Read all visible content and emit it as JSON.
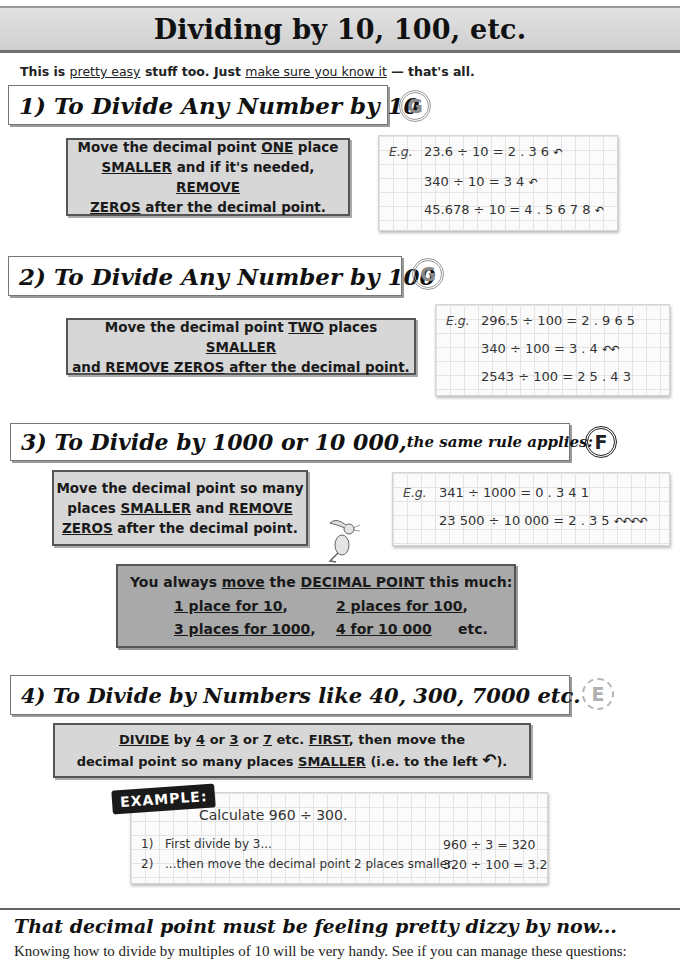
{
  "page": {
    "title": "Dividing by 10, 100, etc.",
    "intro": {
      "p1": "This is ",
      "u1": "pretty easy",
      "p2": " stuff too.  Just ",
      "u2": "make sure you know it",
      "p3": " — that's all."
    }
  },
  "sections": [
    {
      "heading": "1) To Divide Any Number by 10",
      "grade": "G",
      "rule": {
        "l1a": "Move the decimal point ",
        "l1u": "ONE",
        "l1b": " place",
        "l2u": "SMALLER",
        "l2a": " and if it's needed, ",
        "l2u2": "REMOVE",
        "l3u": "ZEROS",
        "l3a": " after the decimal point."
      },
      "example": {
        "label": "E.g.",
        "lines": [
          {
            "eq": "23.6 ÷ 10 = 2 . 3 6",
            "arrows": "↶"
          },
          {
            "eq": "340 ÷ 10 = 3 4",
            "arrows": "↶"
          },
          {
            "eq": "45.678 ÷ 10 = 4 . 5 6 7 8",
            "arrows": "↶"
          }
        ]
      }
    },
    {
      "heading": "2) To Divide Any Number by 100",
      "grade": "G",
      "rule": {
        "l1a": "Move the decimal point ",
        "l1u": "TWO",
        "l1b": " places ",
        "l1u2": "SMALLER",
        "l2a": "and ",
        "l2u": "REMOVE ZEROS",
        "l2b": " after the decimal point."
      },
      "example": {
        "label": "E.g.",
        "lines": [
          {
            "eq": "296.5 ÷ 100  = 2 . 9 6 5",
            "arrows": "↶↶"
          },
          {
            "eq": "340 ÷ 100 = 3 . 4",
            "arrows": "↶↶"
          },
          {
            "eq": "2543 ÷ 100 = 2 5 . 4 3",
            "arrows": "↶↶"
          }
        ]
      }
    },
    {
      "heading_main": "3) To Divide by 1000 or 10 000,",
      "heading_sub": " the same rule applies:",
      "grade": "F",
      "rule": {
        "l1": "Move the decimal point so many",
        "l2a": "places ",
        "l2u": "SMALLER",
        "l2b": " and ",
        "l2u2": "REMOVE",
        "l3u": "ZEROS",
        "l3a": " after the decimal point."
      },
      "example": {
        "label": "E.g.",
        "lines": [
          {
            "eq": "341 ÷ 1000 = 0 . 3 4 1",
            "arrows": "↶↶↶"
          },
          {
            "eq": "23 500 ÷ 10 000 = 2 . 3 5",
            "arrows": "↶↶↶↶"
          }
        ]
      }
    },
    {
      "heading": "4) To Divide by Numbers like 40, 300, 7000 etc.",
      "grade": "E",
      "rule": {
        "l1u": "DIVIDE",
        "l1a": " by ",
        "l1u2": "4",
        "l1b": " or ",
        "l1u3": "3",
        "l1c": " or ",
        "l1u4": "7",
        "l1d": " etc. ",
        "l1u5": "FIRST",
        "l1e": ", then move the",
        "l2a": "decimal point so many places ",
        "l2u": "SMALLER",
        "l2b": " (i.e. to the left ",
        "l2arrow": "↶",
        "l2c": ")."
      },
      "example": {
        "tag": "EXAMPLE:",
        "prompt": "Calculate 960 ÷ 300.",
        "steps": [
          {
            "num": "1)",
            "text": "First divide by 3...",
            "calc": "960 ÷ 3 = 320"
          },
          {
            "num": "2)",
            "text": "...then move the decimal point 2 places smaller.",
            "calc": "320 ÷ 100 = 3.2"
          }
        ]
      }
    }
  ],
  "summary": {
    "l1a": "You always ",
    "l1u": "move",
    "l1b": " the ",
    "l1u2": "DECIMAL POINT",
    "l1c": " this much:",
    "c1": "1 place for 10",
    "c2": "2 places for 100",
    "c3": "3 places for 1000",
    "c4": "4 for 10 000",
    "etc": "etc."
  },
  "footer": {
    "title": "That decimal point must be feeling pretty dizzy by now...",
    "text": "Knowing how to divide by multiples of 10 will be very handy.  See if you can manage these questions:"
  }
}
